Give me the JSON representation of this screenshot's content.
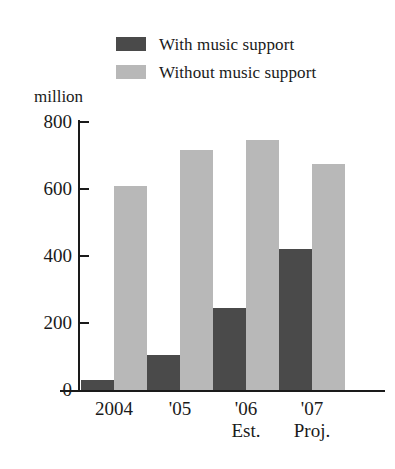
{
  "chart_data": {
    "type": "bar",
    "title": "",
    "subtitle": "",
    "xlabel": "",
    "ylabel": "million",
    "ylim": [
      0,
      800
    ],
    "yticks": [
      0,
      200,
      400,
      600,
      800
    ],
    "grid": false,
    "legend_position": "top",
    "categories": [
      "2004",
      "'05",
      "'06",
      "'07"
    ],
    "category_sublabels": [
      "",
      "",
      "Est.",
      "Proj."
    ],
    "series": [
      {
        "name": "With music support",
        "color": "#4a4a4a",
        "values": [
          30,
          105,
          245,
          420
        ]
      },
      {
        "name": "Without music support",
        "color": "#b8b8b8",
        "values": [
          610,
          715,
          745,
          675
        ]
      }
    ]
  },
  "legend": {
    "items": [
      {
        "label": "With music support",
        "swatch_name": "legend-swatch-with-music-support"
      },
      {
        "label": "Without music support",
        "swatch_name": "legend-swatch-without-music-support"
      }
    ]
  },
  "axes": {
    "y_unit": "million",
    "y_tick_labels": [
      "800",
      "600",
      "400",
      "200",
      "0"
    ],
    "x_tick_labels": [
      "2004",
      "'05",
      "'06",
      "'07"
    ],
    "x_tick_sublabels": [
      "",
      "",
      "Est.",
      "Proj."
    ]
  }
}
